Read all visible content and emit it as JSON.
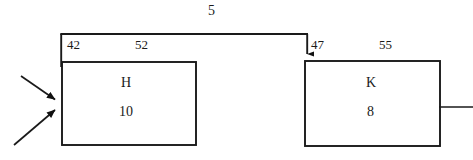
{
  "diagram": {
    "type": "block-flow-diagram",
    "stroke_color": "#1a1a1a",
    "background_color": "#ffffff",
    "flow_label": "5",
    "blocks": [
      {
        "id": "block-h",
        "name": "H",
        "value": "10",
        "top_left_label": "42",
        "top_right_label": "52"
      },
      {
        "id": "block-k",
        "name": "K",
        "value": "8",
        "top_left_label": "47",
        "top_right_label": "55"
      }
    ],
    "connectors": [
      {
        "id": "inlet-arrow-upper",
        "from": "upper-left",
        "to": "block-h"
      },
      {
        "id": "inlet-arrow-lower",
        "from": "lower-left",
        "to": "block-h"
      },
      {
        "id": "h-to-k-line",
        "from": "block-h",
        "to": "block-k",
        "label": "5"
      },
      {
        "id": "outlet-line",
        "from": "block-k",
        "to": "right-edge"
      }
    ]
  }
}
